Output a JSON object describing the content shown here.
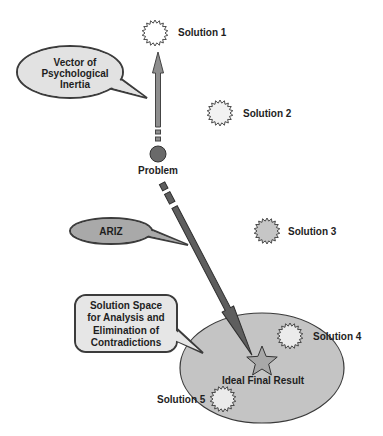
{
  "diagram": {
    "callouts": {
      "psychological_inertia": {
        "lines": [
          "Vector of",
          "Psychological",
          "Inertia"
        ]
      },
      "ariz": {
        "label": "ARIZ"
      },
      "solution_space": {
        "lines": [
          "Solution Space",
          "for Analysis and",
          "Elimination of",
          "Contradictions"
        ]
      }
    },
    "nodes": {
      "problem": "Problem",
      "ideal_final_result": "Ideal Final Result"
    },
    "solutions": [
      {
        "label": "Solution 1",
        "fill": "#ffffff"
      },
      {
        "label": "Solution 2",
        "fill": "#f2f2f2"
      },
      {
        "label": "Solution 3",
        "fill": "#c6c6c6"
      },
      {
        "label": "Solution 4",
        "fill": "#ebebeb"
      },
      {
        "label": "Solution 5",
        "fill": "#ebebeb"
      }
    ],
    "colors": {
      "solution_space_ellipse": "#c4c4c4",
      "inertia_bubble": "#e2e2e2",
      "ariz_bubble": "#a9a9a9",
      "solution_space_bubble": "#e6e6e6",
      "inertia_arrow": "#8e8e8e",
      "ariz_arrow": "#5e5e5e",
      "problem_node": "#6a6a6a",
      "ideal_star": "#a8a8a8"
    }
  }
}
